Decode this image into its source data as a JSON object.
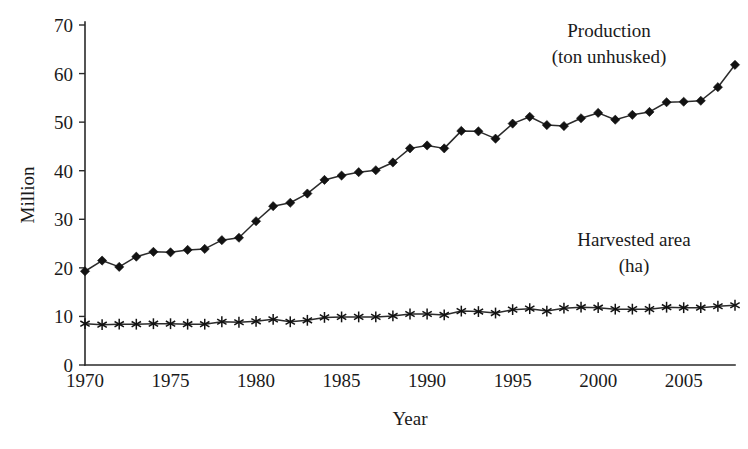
{
  "chart_data": {
    "type": "line",
    "title": "",
    "xlabel": "Year",
    "ylabel": "Million",
    "xlim": [
      1970,
      2008
    ],
    "ylim": [
      0,
      70
    ],
    "ytick_step": 10,
    "xtick_step": 5,
    "grid": false,
    "legend_position": "inline-annotations",
    "x": [
      1970,
      1971,
      1972,
      1973,
      1974,
      1975,
      1976,
      1977,
      1978,
      1979,
      1980,
      1981,
      1982,
      1983,
      1984,
      1985,
      1986,
      1987,
      1988,
      1989,
      1990,
      1991,
      1992,
      1993,
      1994,
      1995,
      1996,
      1997,
      1998,
      1999,
      2000,
      2001,
      2002,
      2003,
      2004,
      2005,
      2006,
      2007,
      2008
    ],
    "xticks": [
      1970,
      1975,
      1980,
      1985,
      1990,
      1995,
      2000,
      2005
    ],
    "xtick_labels": [
      "1970",
      "1975",
      "1980",
      "1985",
      "1990",
      "1995",
      "2000",
      "2005"
    ],
    "yticks": [
      0,
      10,
      20,
      30,
      40,
      50,
      60,
      70
    ],
    "ytick_labels": [
      "0",
      "10",
      "20",
      "30",
      "40",
      "50",
      "60",
      "70"
    ],
    "series": [
      {
        "name": "Production (ton unhusked)",
        "marker": "diamond",
        "color": "#121212",
        "values": [
          19.3,
          21.5,
          20.2,
          22.3,
          23.3,
          23.2,
          23.7,
          23.9,
          25.7,
          26.2,
          29.6,
          32.7,
          33.4,
          35.3,
          38.1,
          39.0,
          39.7,
          40.1,
          41.7,
          44.6,
          45.2,
          44.6,
          48.2,
          48.1,
          46.6,
          49.7,
          51.1,
          49.4,
          49.2,
          50.8,
          51.9,
          50.5,
          51.5,
          52.1,
          54.1,
          54.2,
          54.4,
          57.2,
          61.8
        ]
      },
      {
        "name": "Harvested area (ha)",
        "marker": "asterisk",
        "color": "#121212",
        "values": [
          8.5,
          8.3,
          8.4,
          8.4,
          8.5,
          8.5,
          8.4,
          8.4,
          8.9,
          8.8,
          9.0,
          9.4,
          8.9,
          9.2,
          9.8,
          9.9,
          9.9,
          9.9,
          10.1,
          10.5,
          10.5,
          10.3,
          11.1,
          11.0,
          10.7,
          11.4,
          11.6,
          11.1,
          11.7,
          11.9,
          11.8,
          11.5,
          11.5,
          11.5,
          11.9,
          11.8,
          11.8,
          12.1,
          12.3
        ]
      }
    ],
    "annotations": [
      {
        "name": "production-label",
        "lines": [
          "Production",
          "(ton unhusked)"
        ],
        "x_px": 609,
        "y_px": 37
      },
      {
        "name": "harvested-area-label",
        "lines": [
          "Harvested area",
          "(ha)"
        ],
        "x_px": 634,
        "y_px": 246
      }
    ]
  }
}
